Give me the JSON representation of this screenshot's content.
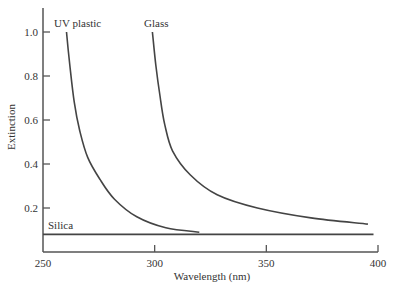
{
  "chart_data": {
    "type": "line",
    "title": "",
    "xlabel": "Wavelength (nm)",
    "ylabel": "Extinction",
    "xlim": [
      250,
      400
    ],
    "ylim": [
      0,
      1.1
    ],
    "xticks": [
      250,
      300,
      350,
      400
    ],
    "yticks": [
      0.2,
      0.4,
      0.6,
      0.8,
      1.0
    ],
    "xtick_labels": [
      "250",
      "300",
      "350",
      "400"
    ],
    "ytick_labels": [
      "0.2",
      "0.4",
      "0.6",
      "0.8",
      "1.0"
    ],
    "grid": false,
    "legend": "inline labels",
    "series": [
      {
        "name": "UV plastic",
        "x": [
          260.5,
          262,
          264,
          266.5,
          270,
          275.5,
          282,
          292,
          305,
          320
        ],
        "values": [
          1.0,
          0.85,
          0.68,
          0.55,
          0.43,
          0.33,
          0.24,
          0.16,
          0.11,
          0.09
        ]
      },
      {
        "name": "Glass",
        "x": [
          299,
          300.5,
          302.5,
          304.5,
          308,
          316,
          328,
          346,
          370,
          395.5
        ],
        "values": [
          1.0,
          0.85,
          0.7,
          0.58,
          0.46,
          0.35,
          0.26,
          0.2,
          0.155,
          0.127
        ]
      },
      {
        "name": "Silica",
        "x": [
          250,
          398
        ],
        "values": [
          0.08,
          0.08
        ]
      }
    ]
  },
  "colors": {
    "line": "#444444",
    "axis": "#555555",
    "text": "#333333"
  }
}
